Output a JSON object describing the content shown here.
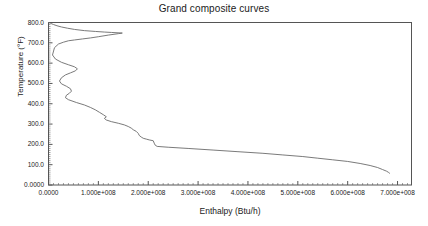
{
  "chart_data": {
    "type": "line",
    "title": "Grand composite curves",
    "xlabel": "Enthalpy (Btu/h)",
    "ylabel": "Temperature (°F)",
    "xlim": [
      0,
      728000000
    ],
    "ylim": [
      0,
      800
    ],
    "grid": false,
    "legend": null,
    "line_color": "#6b6b6b",
    "frame_color": "#555555",
    "xticks": [
      0,
      100000000,
      200000000,
      300000000,
      400000000,
      500000000,
      600000000,
      700000000
    ],
    "xticklabels": [
      "0.0000",
      "1.000e+008",
      "2.000e+008",
      "3.000e+008",
      "4.000e+008",
      "5.000e+008",
      "6.000e+008",
      "7.000e+008"
    ],
    "yticks": [
      0,
      100,
      200,
      300,
      400,
      500,
      600,
      700,
      800
    ],
    "yticklabels": [
      "0.0000",
      "100.0",
      "200.0",
      "300.0",
      "400.0",
      "500.0",
      "600.0",
      "700.0",
      "800.0"
    ],
    "minor_ticks_per_interval": 10,
    "series": [
      {
        "name": "Grand composite curve",
        "x": [
          0,
          4000000,
          10000000,
          17000000,
          26000000,
          38000000,
          52000000,
          72000000,
          94000000,
          112000000,
          126000000,
          148000000,
          140000000,
          120000000,
          100000000,
          84000000,
          68000000,
          52000000,
          40000000,
          30000000,
          20000000,
          12000000,
          8000000,
          14000000,
          26000000,
          40000000,
          52000000,
          58000000,
          54000000,
          44000000,
          34000000,
          26000000,
          22000000,
          26000000,
          36000000,
          44000000,
          46000000,
          42000000,
          36000000,
          34000000,
          40000000,
          56000000,
          72000000,
          84000000,
          94000000,
          102000000,
          110000000,
          116000000,
          112000000,
          116000000,
          126000000,
          140000000,
          152000000,
          160000000,
          166000000,
          170000000,
          176000000,
          180000000,
          182000000,
          186000000,
          190000000,
          196000000,
          202000000,
          210000000,
          212000000,
          214000000,
          218000000,
          240000000,
          280000000,
          330000000,
          380000000,
          430000000,
          470000000,
          510000000,
          540000000,
          570000000,
          600000000,
          625000000,
          645000000,
          660000000,
          670000000,
          678000000,
          682000000,
          684000000
        ],
        "y": [
          800,
          796,
          790,
          784,
          778,
          772,
          766,
          760,
          756,
          753,
          751,
          748,
          745,
          738,
          730,
          724,
          719,
          714,
          710,
          703,
          694,
          676,
          640,
          620,
          604,
          592,
          582,
          572,
          562,
          552,
          542,
          528,
          512,
          498,
          486,
          474,
          462,
          452,
          442,
          430,
          420,
          406,
          394,
          382,
          370,
          358,
          346,
          336,
          328,
          320,
          312,
          304,
          296,
          288,
          280,
          272,
          264,
          254,
          244,
          236,
          230,
          226,
          222,
          218,
          206,
          196,
          190,
          186,
          180,
          172,
          164,
          156,
          148,
          140,
          132,
          124,
          116,
          106,
          96,
          86,
          76,
          68,
          62,
          58
        ]
      }
    ]
  }
}
